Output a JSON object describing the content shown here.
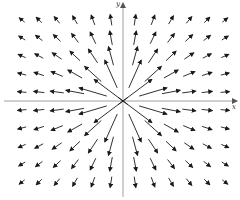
{
  "diagram": {
    "type": "vector-field",
    "axes": {
      "x_label": "x",
      "y_label": "y",
      "origin_px": [
        123,
        101
      ]
    },
    "grid": {
      "columns_px": [
        22,
        39,
        57,
        75,
        93,
        111,
        135,
        153,
        171,
        189,
        207,
        225
      ],
      "rows_px": [
        20,
        38,
        56,
        74,
        92,
        110,
        128,
        146,
        164,
        182
      ]
    },
    "field": "F(x,y) = (x, y) / (x^2 + y^2)",
    "colors": {
      "arrow": "#1a1a1a",
      "axis": "#888888",
      "background": "#ffffff"
    }
  }
}
